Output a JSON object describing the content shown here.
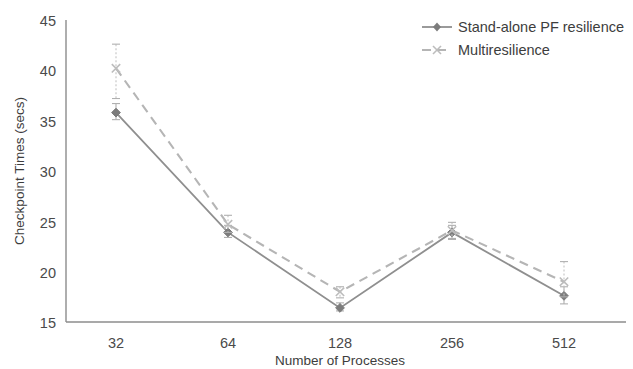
{
  "chart_data": {
    "type": "line",
    "title": "",
    "xlabel": "Number of Processes",
    "ylabel": "Checkpoint Times (secs)",
    "categories": [
      "32",
      "64",
      "128",
      "256",
      "512"
    ],
    "xticks": [
      "32",
      "64",
      "128",
      "256",
      "512"
    ],
    "yticks": [
      "15",
      "20",
      "25",
      "30",
      "35",
      "40",
      "45"
    ],
    "ylim": [
      15,
      45
    ],
    "grid": false,
    "legend_position": "top-right",
    "series": [
      {
        "name": "Stand-alone PF resilience",
        "style": "solid",
        "marker": "diamond",
        "color": "#8f8f8f",
        "values": [
          35.8,
          23.9,
          16.4,
          23.9,
          17.6
        ],
        "err_low": [
          35.1,
          23.4,
          16.1,
          23.2,
          16.8
        ],
        "err_high": [
          36.7,
          24.6,
          16.9,
          24.6,
          18.5
        ]
      },
      {
        "name": "Multiresilience",
        "style": "dashed",
        "marker": "x",
        "color": "#b5b5b5",
        "values": [
          40.2,
          24.7,
          18.0,
          24.1,
          19.0
        ],
        "err_low": [
          37.2,
          23.9,
          17.4,
          23.3,
          17.5
        ],
        "err_high": [
          42.6,
          25.6,
          18.5,
          24.9,
          21.0
        ]
      }
    ]
  },
  "legend": {
    "items": [
      {
        "label": "Stand-alone PF resilience"
      },
      {
        "label": "Multiresilience"
      }
    ]
  },
  "axes": {
    "y_title": "Checkpoint Times (secs)",
    "x_title": "Number of Processes"
  }
}
